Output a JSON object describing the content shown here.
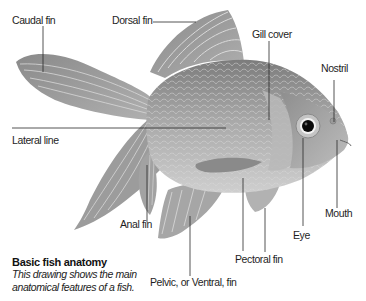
{
  "diagram": {
    "title": "Basic fish anatomy",
    "description_line1": "This drawing shows the main",
    "description_line2": "anatomical features of a fish.",
    "labels": {
      "caudal_fin": "Caudal fin",
      "dorsal_fin": "Dorsal fin",
      "gill_cover": "Gill cover",
      "nostril": "Nostril",
      "lateral_line": "Lateral line",
      "anal_fin": "Anal fin",
      "mouth": "Mouth",
      "eye": "Eye",
      "pectoral_fin": "Pectoral fin",
      "pelvic_fin": "Pelvic, or Ventral, fin"
    },
    "colors": {
      "background": "#ffffff",
      "fish_body": "#9a9a9a",
      "fin_rays": "#8c8c8c",
      "leader_line": "#2a2a2a",
      "text": "#1e1e1e"
    }
  }
}
